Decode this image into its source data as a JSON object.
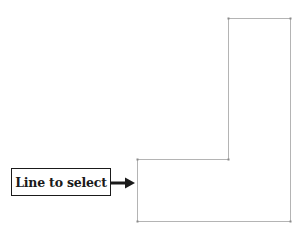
{
  "callout": {
    "label": "Line to select"
  },
  "shape": {
    "type": "L-shaped outline",
    "stroke_color": "#b4b4b4",
    "vertex_marker_color": "#8a8a8a"
  },
  "arrow": {
    "color": "#1a1a1a",
    "direction": "right"
  }
}
